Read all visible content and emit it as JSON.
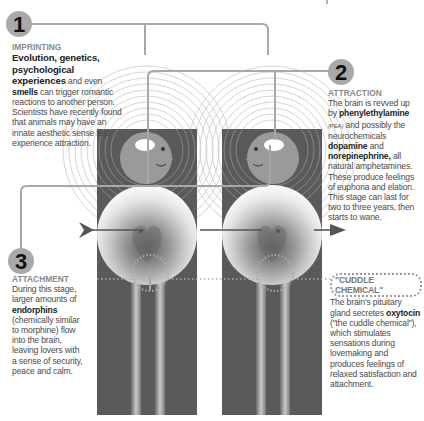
{
  "stages": [
    {
      "number": "1",
      "title": "IMPRINTING",
      "lead": "Evolution, genetics, psychological experiences",
      "body_parts": [
        {
          "text": " and even ",
          "bold": false
        },
        {
          "text": "smells",
          "bold": true
        },
        {
          "text": " can trigger romantic reactions to another person. Scientists have recently found that animals may have an innate aesthetic sense and experience attraction.",
          "bold": false
        }
      ]
    },
    {
      "number": "2",
      "title": "ATTRACTION",
      "body_parts": [
        {
          "text": "The brain is revved up by ",
          "bold": false
        },
        {
          "text": "phenylethylamine",
          "bold": true
        },
        {
          "text": " (PEA)",
          "small": true
        },
        {
          "text": " and possibly the neurochemicals ",
          "bold": false
        },
        {
          "text": "dopamine",
          "bold": true
        },
        {
          "text": " and ",
          "bold": false
        },
        {
          "text": "norepinephrine,",
          "bold": true
        },
        {
          "text": " all natural amphetamines. These produce feelings of euphoria and elation. This stage can last for two to three years, then starts to wane.",
          "bold": false
        }
      ]
    },
    {
      "number": "3",
      "title": "ATTACHMENT",
      "body_parts": [
        {
          "text": "During this stage, larger amounts of ",
          "bold": false
        },
        {
          "text": "endorphins",
          "bold": true
        },
        {
          "text": " (chemically similar to morphine) flow into the brain, leaving lovers with a sense of security, peace and calm.",
          "bold": false
        }
      ]
    }
  ],
  "cuddle": {
    "title": "\"CUDDLE CHEMICAL\"",
    "body_parts": [
      {
        "text": "The brain's pituitary gland secretes ",
        "bold": false
      },
      {
        "text": "oxytocin",
        "bold": true
      },
      {
        "text": " (\"the cuddle chemical\"), which stimulates sensations during lovemaking and produces feelings of relaxed satisfaction and attachment.",
        "bold": false
      }
    ]
  },
  "colors": {
    "panel": "#5a5a5a",
    "connector": "#a8a8a8",
    "number_badge": "#a9a9a9",
    "heading_gray": "#8a8a8a",
    "body_text": "#4a4a4a"
  }
}
